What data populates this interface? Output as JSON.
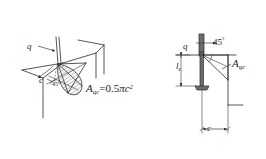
{
  "figure": {
    "background_color": "#ffffff",
    "line_color": "#2b2b2b"
  },
  "left_view": {
    "name": "perspective-view",
    "labels": {
      "load_symbol": "q",
      "edge_distance_symbol": "c",
      "angle": "45",
      "angle_unit": "°"
    },
    "formula": {
      "area_symbol": "A",
      "area_subscript": "qc",
      "equals": "=",
      "coefficient": "0.5",
      "pi": "π",
      "variable": "c",
      "exponent": "2",
      "full_text": "A_qc = 0.5πc²"
    }
  },
  "right_view": {
    "name": "elevation-view",
    "labels": {
      "load_symbol": "q",
      "angle": "45",
      "angle_unit": "°",
      "embedment_symbol": "l",
      "embedment_subscript": "e",
      "area_symbol": "A",
      "area_subscript": "qc",
      "edge_distance_symbol": "c"
    }
  }
}
